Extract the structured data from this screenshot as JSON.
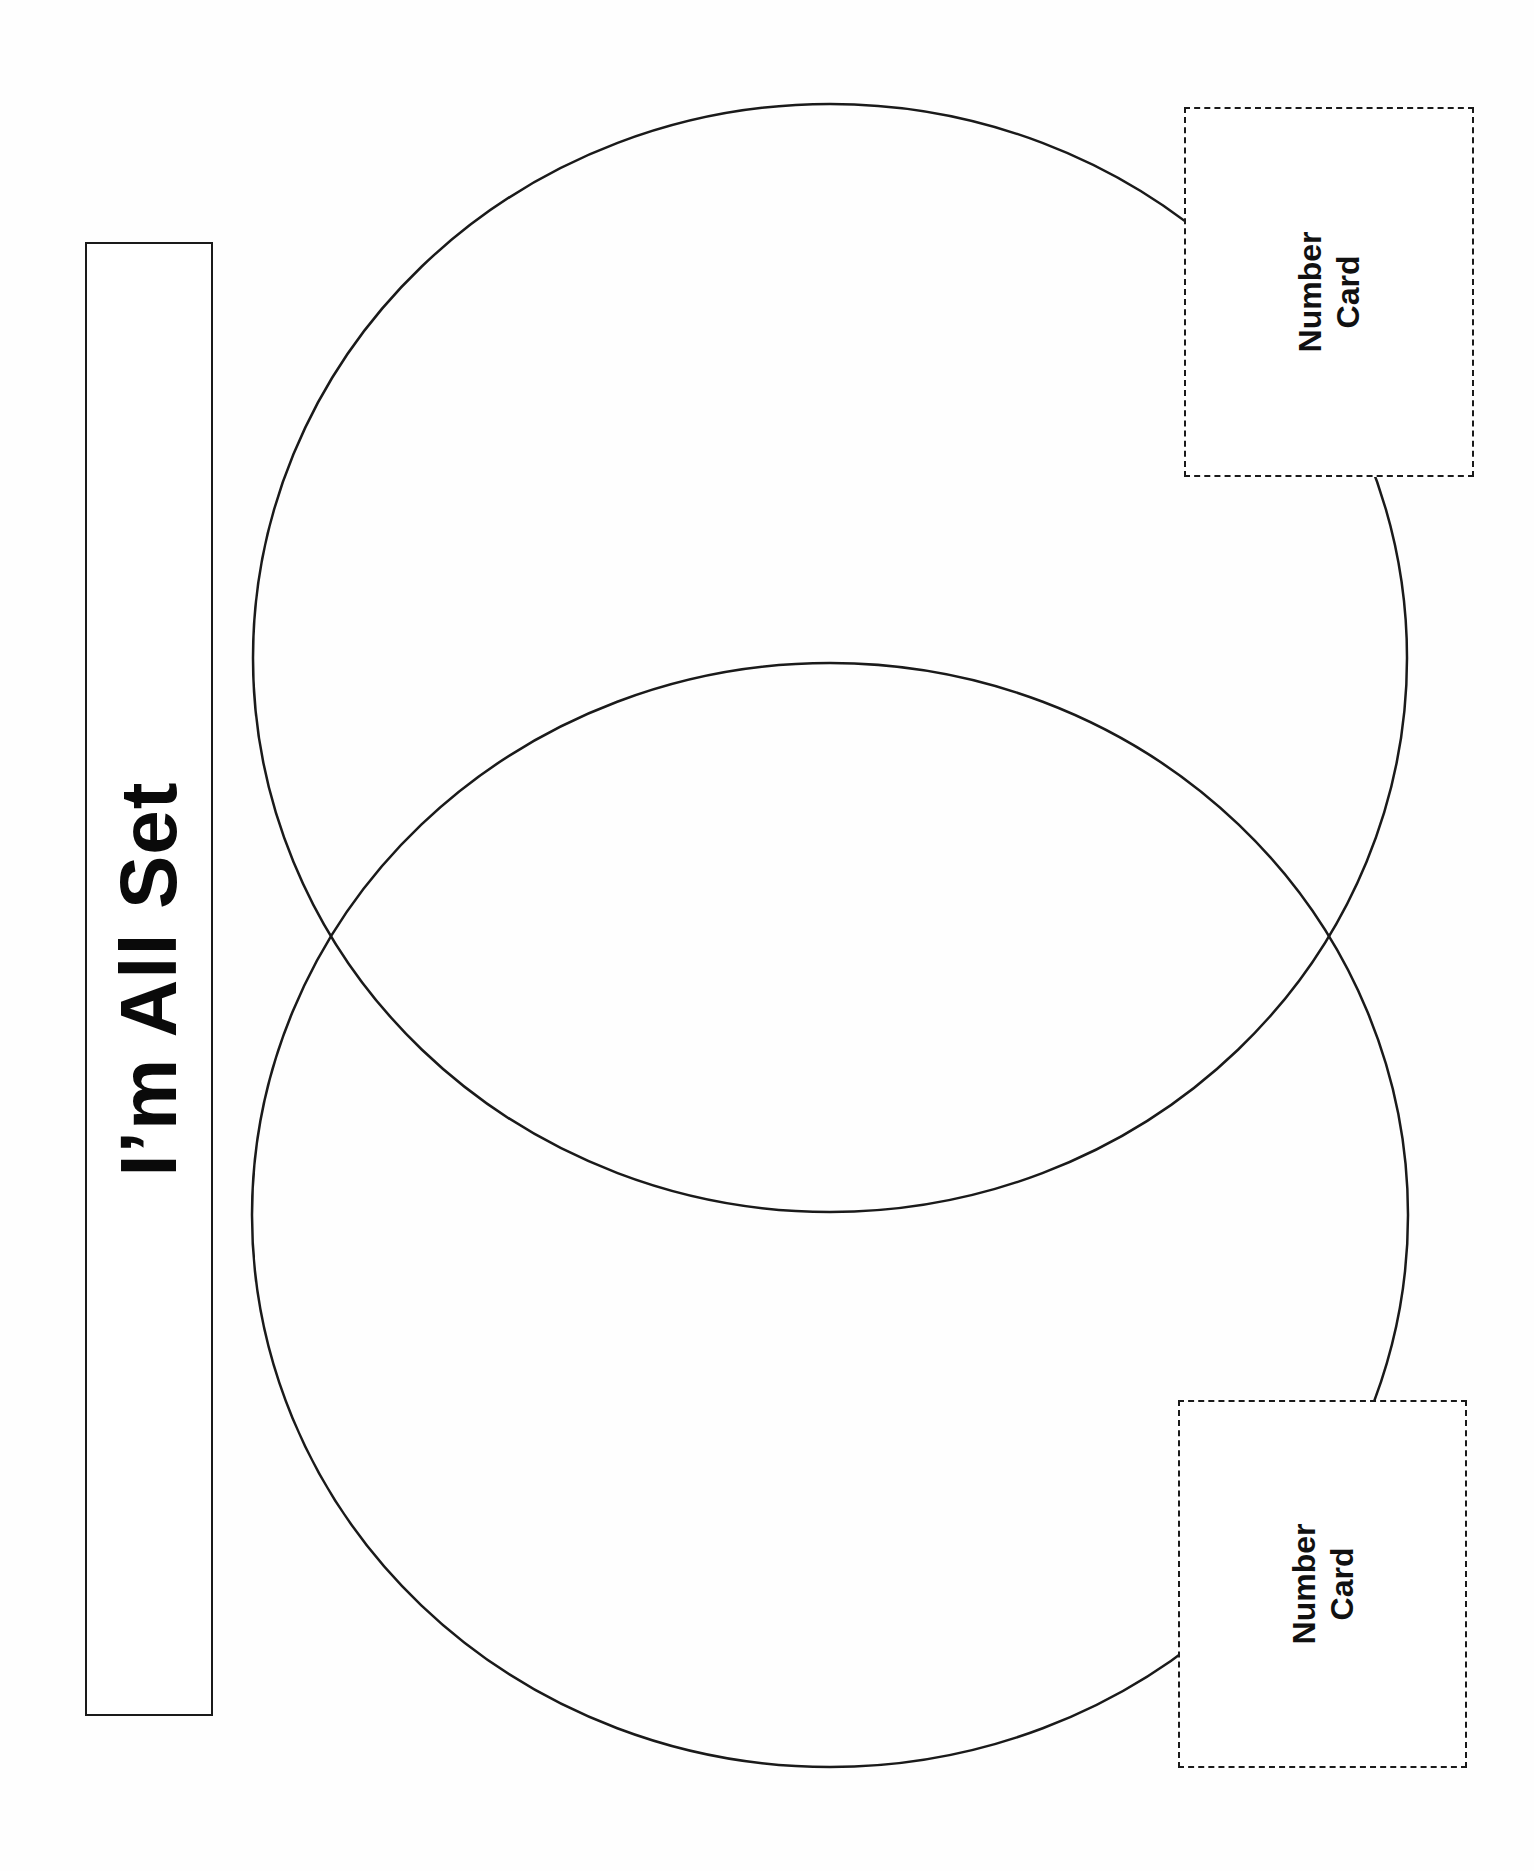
{
  "title": "I’m All Set",
  "venn": {
    "circles": [
      {
        "name": "top-set",
        "cx": 830,
        "cy": 658,
        "rx": 577,
        "ry": 554
      },
      {
        "name": "bottom-set",
        "cx": 830,
        "cy": 1215,
        "rx": 578,
        "ry": 552
      }
    ],
    "stroke_color": "#1a1a1a"
  },
  "cards": {
    "top": {
      "line1": "Number",
      "line2": "Card"
    },
    "bottom": {
      "line1": "Number",
      "line2": "Card"
    }
  }
}
